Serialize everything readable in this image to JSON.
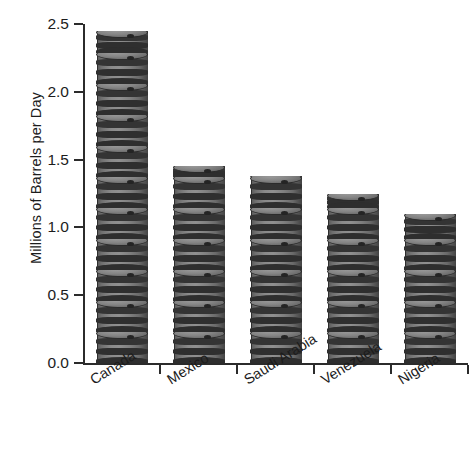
{
  "chart_data": {
    "type": "bar",
    "title": "",
    "xlabel": "",
    "ylabel": "Millions of Barrels per Day",
    "categories": [
      "Canada",
      "Mexico",
      "Saudi Arabia",
      "Venezuela",
      "Nigeria"
    ],
    "values": [
      2.45,
      1.45,
      1.38,
      1.25,
      1.1
    ],
    "ylim": [
      0.0,
      2.5
    ],
    "ytick_labels": [
      "0.0",
      "0.5",
      "1.0",
      "1.5",
      "2.0",
      "2.5"
    ],
    "ytick_values": [
      0.0,
      0.5,
      1.0,
      1.5,
      2.0,
      2.5
    ],
    "grid": false,
    "legend": null,
    "pictogram": "oil-barrel",
    "colors": {
      "barrel_body": "#808080",
      "barrel_outline": "#2b2b2b",
      "axis": "#2b2b2b",
      "text": "#1c1c1c",
      "background": "#ffffff"
    }
  },
  "axis": {
    "y_title": "Millions of Barrels per Day"
  }
}
